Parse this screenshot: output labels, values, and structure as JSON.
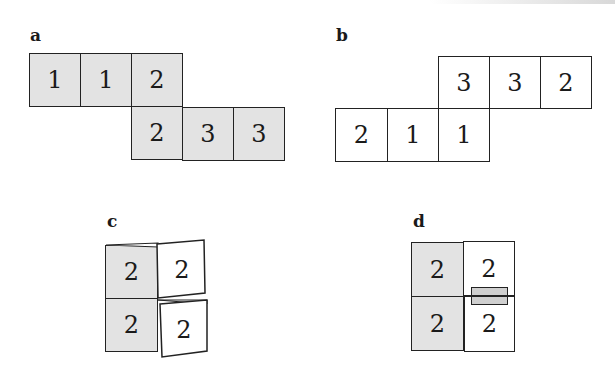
{
  "figure": {
    "panels": [
      {
        "label": "a",
        "rows": [
          [
            "1",
            "1",
            "2"
          ],
          [
            "2",
            "3",
            "3"
          ]
        ],
        "fill": "#e3e3e3"
      },
      {
        "label": "b",
        "rows": [
          [
            "3",
            "3",
            "2"
          ],
          [
            "2",
            "1",
            "1"
          ]
        ],
        "fill": "#ffffff"
      },
      {
        "label": "c",
        "cells": [
          "2",
          "2",
          "2",
          "2"
        ],
        "shaded_left": true
      },
      {
        "label": "d",
        "cells": [
          "2",
          "2",
          "2",
          "2"
        ],
        "shaded_left": true,
        "overlap_rect": true
      }
    ],
    "colors": {
      "shaded": "#e3e3e3",
      "line": "#222222",
      "background": "#ffffff"
    }
  }
}
